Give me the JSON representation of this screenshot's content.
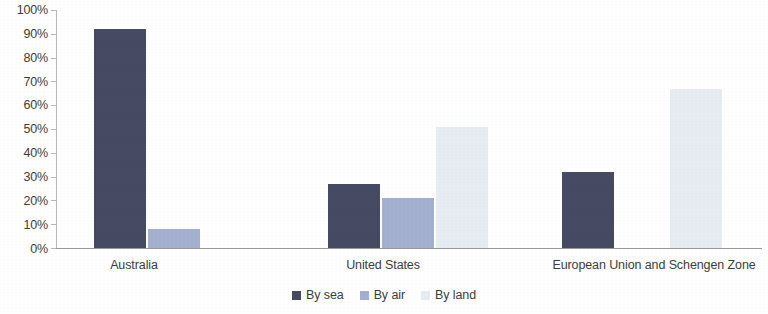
{
  "chart_data": {
    "type": "bar",
    "title": "",
    "subtitle": "",
    "xlabel": "",
    "ylabel": "",
    "ylim": [
      0,
      100
    ],
    "grid": false,
    "legend_position": "bottom-center",
    "y_ticks": [
      "0%",
      "10%",
      "20%",
      "30%",
      "40%",
      "50%",
      "60%",
      "70%",
      "80%",
      "90%",
      "100%"
    ],
    "categories": [
      "Australia",
      "United States",
      "European Union and Schengen Zone"
    ],
    "series": [
      {
        "name": "By sea",
        "color": "#464b63",
        "values": [
          92,
          27,
          32
        ]
      },
      {
        "name": "By air",
        "color": "#a3b0d0",
        "values": [
          8,
          21,
          null
        ]
      },
      {
        "name": "By land",
        "color": "#e8edf3",
        "values": [
          null,
          51,
          67
        ]
      }
    ]
  },
  "legend": {
    "items": [
      {
        "label": "By sea",
        "key": "sea"
      },
      {
        "label": "By air",
        "key": "air"
      },
      {
        "label": "By land",
        "key": "land"
      }
    ]
  },
  "axis": {
    "y_tick_0": "0%",
    "y_tick_10": "10%",
    "y_tick_20": "20%",
    "y_tick_30": "30%",
    "y_tick_40": "40%",
    "y_tick_50": "50%",
    "y_tick_60": "60%",
    "y_tick_70": "70%",
    "y_tick_80": "80%",
    "y_tick_90": "90%",
    "y_tick_100": "100%"
  },
  "categories": {
    "cat_0": "Australia",
    "cat_1": "United States",
    "cat_2": "European Union and Schengen Zone"
  },
  "colors": {
    "sea": "#464b63",
    "air": "#a3b0d0",
    "land": "#e8edf3",
    "axis": "#9a9a9a",
    "text": "#3d3d3d",
    "background": "#ffffff"
  }
}
